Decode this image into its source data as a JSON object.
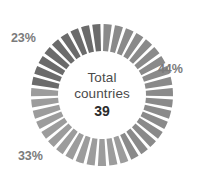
{
  "chart_data": {
    "type": "pie",
    "variant": "donut",
    "title": "",
    "center_label_line1": "Total",
    "center_label_line2": "countries",
    "center_value": "39",
    "total": 39,
    "unit": "%",
    "segment_count": 39,
    "categories": [
      "44%",
      "33%",
      "23%"
    ],
    "values": [
      44,
      33,
      23
    ],
    "series": [
      {
        "name": "share of countries",
        "values": [
          44,
          33,
          23
        ]
      }
    ],
    "slices": [
      {
        "label": "44%",
        "value": 44,
        "count": 17,
        "color": "#8a8a8a",
        "start_angle": 0,
        "end_angle": 158.4
      },
      {
        "label": "33%",
        "value": 33,
        "count": 13,
        "color": "#9c9c9c",
        "start_angle": 158.4,
        "end_angle": 277.2
      },
      {
        "label": "23%",
        "value": 23,
        "count": 9,
        "color": "#6b6b6b",
        "start_angle": 277.2,
        "end_angle": 360
      }
    ],
    "legend": [],
    "legend_position": "none",
    "annotations": [
      "44%",
      "33%",
      "23%"
    ],
    "grid": false,
    "gap_color": "#ffffff",
    "background": "#ffffff"
  },
  "geometry": {
    "center_x": 102,
    "center_y": 95,
    "outer_radius": 71,
    "inner_radius": 44
  }
}
